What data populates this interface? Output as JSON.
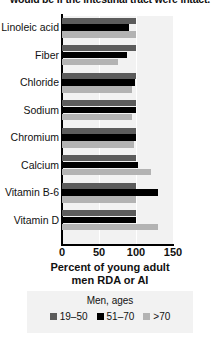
{
  "caption": {
    "text": "would be if the intestinal tract were intact."
  },
  "chart_data": {
    "type": "bar",
    "orientation": "horizontal",
    "title": "",
    "xlabel": "Percent of young adult men RDA or AI",
    "ylabel": "",
    "xlim": [
      0,
      150
    ],
    "xticks": [
      0,
      50,
      100,
      150
    ],
    "xtick_labels": [
      "0",
      "50",
      "100",
      "150"
    ],
    "grid": true,
    "legend_position": "bottom",
    "legend_title": "Men, ages",
    "categories": [
      "Linoleic acid",
      "Fiber",
      "Chloride",
      "Sodium",
      "Chromium",
      "Calcium",
      "Vitamin B-6",
      "Vitamin D"
    ],
    "series": [
      {
        "name": "19–50",
        "color": "#5c5c5c",
        "values": [
          100,
          100,
          100,
          100,
          100,
          100,
          100,
          100
        ]
      },
      {
        "name": "51–70",
        "color": "#000000",
        "values": [
          90,
          88,
          98,
          100,
          100,
          103,
          130,
          100
        ]
      },
      {
        "name": ">70",
        "color": "#b3b3b3",
        "values": [
          100,
          75,
          95,
          95,
          97,
          120,
          100,
          130
        ]
      }
    ]
  }
}
